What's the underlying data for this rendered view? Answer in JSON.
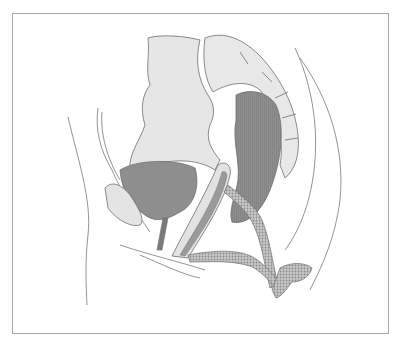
{
  "figure": {
    "type": "anatomical-illustration",
    "view": "sagittal pelvis",
    "style": "grayscale",
    "colors": {
      "background": "#ffffff",
      "frame_border": "#a8a8a8",
      "outline": "#6e6e6e",
      "bone": "#e4e4e4",
      "organ_dark": "#8c8c8c",
      "organ_mid": "#a6a6a6",
      "mesh": "#b4b4b4"
    }
  }
}
